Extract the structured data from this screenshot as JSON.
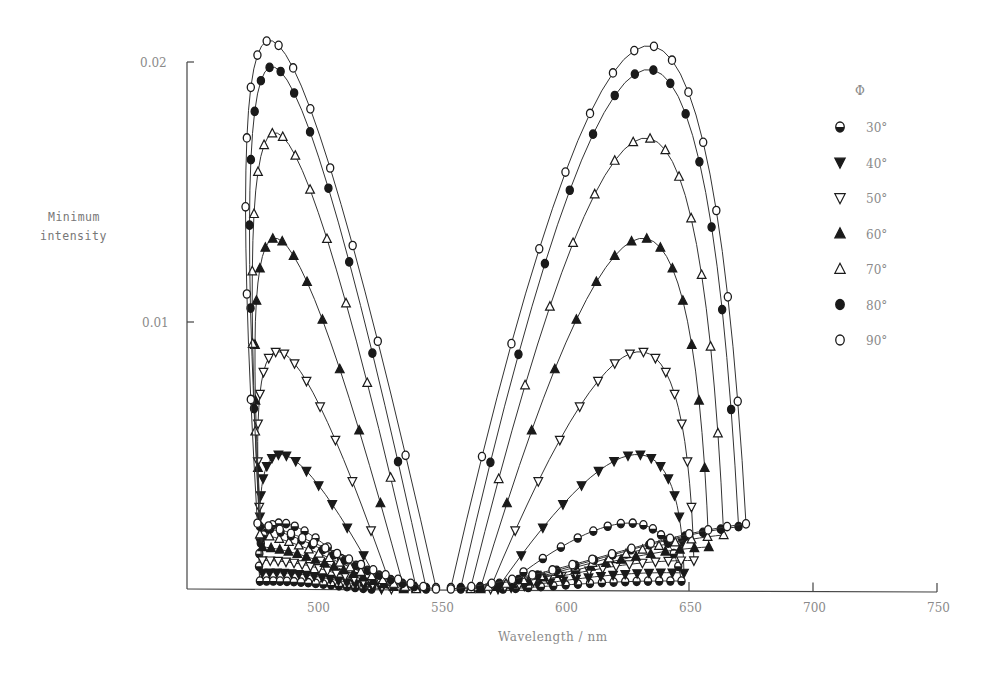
{
  "chart_data": {
    "type": "line",
    "title": "",
    "xlabel": "Wavelength / nm",
    "ylabel": "Minimum intensity",
    "xlim": [
      447,
      750
    ],
    "ylim": [
      0,
      0.0215
    ],
    "x_ticks": [
      500,
      550,
      600,
      650,
      700,
      750
    ],
    "y_ticks": [
      0.01,
      0.02
    ],
    "y_tick_labels": [
      "0.01",
      "0.02"
    ],
    "x_tick_labels": [
      "500",
      "550",
      "600",
      "650",
      "700",
      "750"
    ],
    "grid": false,
    "legend_title": "Φ",
    "legend_position": "right",
    "series": [
      {
        "name": "30°",
        "marker": "half-filled-circle",
        "left_peak": [
          486,
          0.0025
        ],
        "right_peak": [
          625,
          0.0025
        ],
        "left_span": [
          477,
          522
        ],
        "right_span": [
          575,
          647
        ]
      },
      {
        "name": "40°",
        "marker": "filled-triangle-down",
        "left_peak": [
          486,
          0.0051
        ],
        "right_peak": [
          628,
          0.0051
        ],
        "left_span": [
          478,
          526
        ],
        "right_span": [
          573,
          648
        ]
      },
      {
        "name": "50°",
        "marker": "open-triangle-down",
        "left_peak": [
          485,
          0.009
        ],
        "right_peak": [
          629,
          0.009
        ],
        "left_span": [
          478,
          530
        ],
        "right_span": [
          570,
          652
        ]
      },
      {
        "name": "60°",
        "marker": "filled-triangle-up",
        "left_peak": [
          484,
          0.0133
        ],
        "right_peak": [
          630,
          0.0133
        ],
        "left_span": [
          478,
          535
        ],
        "right_span": [
          566,
          658
        ]
      },
      {
        "name": "70°",
        "marker": "open-triangle-up",
        "left_peak": [
          484,
          0.0173
        ],
        "right_peak": [
          631,
          0.0171
        ],
        "left_span": [
          477,
          540
        ],
        "right_span": [
          562,
          664
        ]
      },
      {
        "name": "80°",
        "marker": "filled-circle",
        "left_peak": [
          483,
          0.0198
        ],
        "right_peak": [
          632,
          0.0197
        ],
        "left_span": [
          477,
          544
        ],
        "right_span": [
          558,
          670
        ]
      },
      {
        "name": "90°",
        "marker": "open-circle",
        "left_peak": [
          482,
          0.0208
        ],
        "right_peak": [
          632,
          0.0206
        ],
        "left_span": [
          476,
          548
        ],
        "right_span": [
          554,
          673
        ]
      }
    ]
  },
  "legend": {
    "title": "Φ",
    "items": [
      "30°",
      "40°",
      "50°",
      "60°",
      "70°",
      "80°",
      "90°"
    ]
  },
  "axes": {
    "xlabel": "Wavelength / nm",
    "ylabel_line1": "Minimum",
    "ylabel_line2": "intensity"
  }
}
